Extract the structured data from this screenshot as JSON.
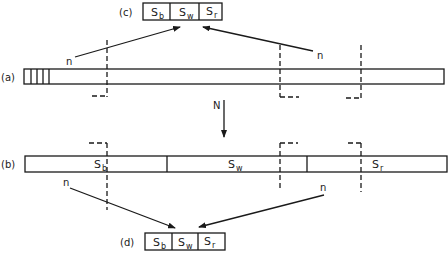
{
  "diagram": {
    "type": "array-partition-sampling",
    "panels": {
      "a": {
        "label": "(a)",
        "hatched_segments": 4
      },
      "b": {
        "label": "(b)",
        "segments": [
          {
            "main": "S",
            "sub": "b"
          },
          {
            "main": "S",
            "sub": "w"
          },
          {
            "main": "S",
            "sub": "r"
          }
        ]
      },
      "c": {
        "label": "(c)",
        "cells": [
          {
            "main": "S",
            "sub": "b"
          },
          {
            "main": "S",
            "sub": "w"
          },
          {
            "main": "S",
            "sub": "r"
          }
        ]
      },
      "d": {
        "label": "(d)",
        "cells": [
          {
            "main": "S",
            "sub": "b"
          },
          {
            "main": "S",
            "sub": "w"
          },
          {
            "main": "S",
            "sub": "r"
          }
        ]
      }
    },
    "arrows": {
      "top_left_label": "n",
      "top_right_label": "n",
      "middle_label": "N",
      "bottom_left_label": "n",
      "bottom_right_label": "n"
    },
    "colors": {
      "stroke": "#1a1a1a",
      "background": "#ffffff"
    }
  }
}
